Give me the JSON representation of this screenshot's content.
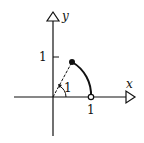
{
  "diagram": {
    "axes": {
      "x_label": "x",
      "y_label": "y"
    },
    "ticks": {
      "x_tick": "1",
      "y_tick": "1"
    },
    "angle_label": "1",
    "points": [
      {
        "name": "terminal-point",
        "style": "filled",
        "description": "point at angle 1 radian on unit circle"
      },
      {
        "name": "start-point",
        "style": "open",
        "description": "(1, 0)"
      }
    ],
    "arc": "unit circle arc from (1,0) to angle 1 radian",
    "colors": {
      "ink": "#111111",
      "background": "#ffffff"
    }
  }
}
